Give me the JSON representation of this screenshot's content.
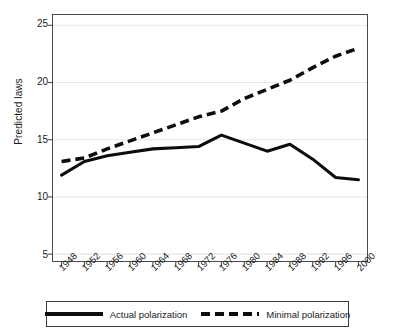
{
  "chart_data": {
    "type": "line",
    "title": "",
    "xlabel": "",
    "ylabel": "Predicted laws",
    "x": [
      1948,
      1952,
      1956,
      1960,
      1964,
      1968,
      1972,
      1976,
      1980,
      1984,
      1988,
      1992,
      1996,
      2000
    ],
    "xtick_labels": [
      "1948",
      "1952",
      "1956",
      "1960",
      "1964",
      "1968",
      "1972",
      "1976",
      "1980",
      "1984",
      "1988",
      "1992",
      "1996",
      "2000"
    ],
    "ytick_labels": [
      "5",
      "10",
      "15",
      "20",
      "25"
    ],
    "yticks": [
      5,
      10,
      15,
      20,
      25
    ],
    "ylim": [
      4.4,
      25.9
    ],
    "xlim": [
      1946.5,
      2001.5
    ],
    "grid": "horizontal",
    "legend_position": "below-axes",
    "series": [
      {
        "name": "Actual polarization",
        "style": "solid",
        "color": "#0d0d0d",
        "values": [
          11.9,
          13.1,
          13.6,
          13.9,
          14.2,
          14.3,
          14.4,
          15.4,
          14.7,
          14.0,
          14.6,
          13.3,
          11.7,
          11.5
        ]
      },
      {
        "name": "Minimal polarization",
        "style": "dashed",
        "color": "#0d0d0d",
        "values": [
          13.1,
          13.4,
          14.2,
          14.9,
          15.6,
          16.3,
          17.0,
          17.5,
          18.6,
          19.4,
          20.2,
          21.3,
          22.3,
          23.0
        ]
      }
    ]
  },
  "axes": {
    "y_title": "Predicted laws"
  },
  "legend": {
    "items": [
      {
        "label": "Actual polarization",
        "style": "solid"
      },
      {
        "label": "Minimal polarization",
        "style": "dashed"
      }
    ]
  }
}
